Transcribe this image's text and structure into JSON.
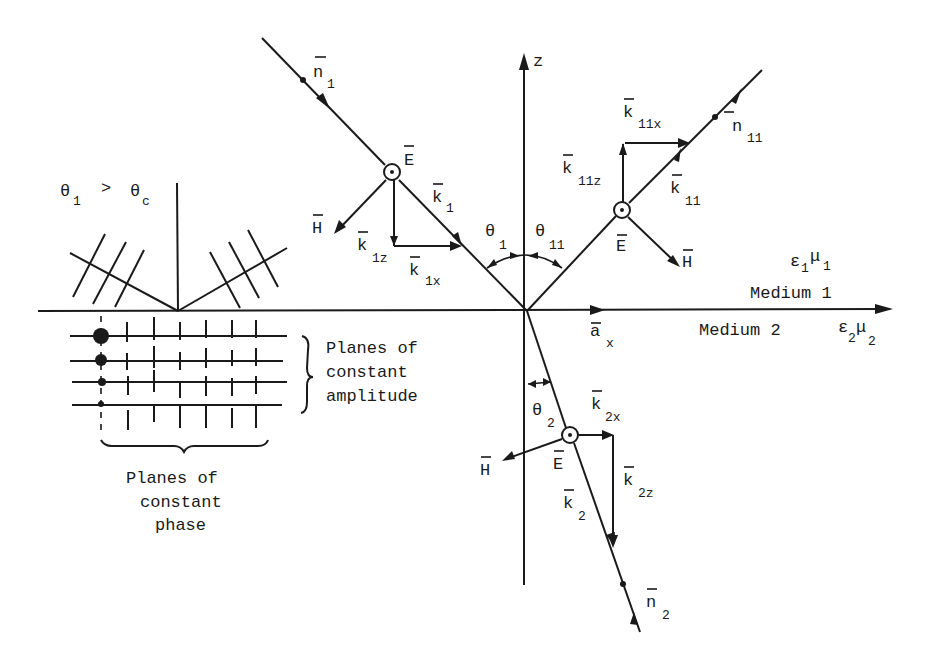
{
  "figure": {
    "condition": {
      "theta": "θ",
      "sub1": "1",
      "gt": ">",
      "theta_c": "θ",
      "subc": "c"
    },
    "axes": {
      "z_label": "z",
      "ax_label": "a",
      "ax_sub": "x"
    },
    "media": {
      "medium1": "Medium 1",
      "medium1_params": {
        "eps": "ε",
        "eps_sub": "1",
        "mu": "μ",
        "mu_sub": "1"
      },
      "medium2": "Medium 2",
      "medium2_params": {
        "eps": "ε",
        "eps_sub": "2",
        "mu": "μ",
        "mu_sub": "2"
      }
    },
    "incident": {
      "n": "n",
      "n_sub": "1",
      "E": "E",
      "H": "H",
      "k": "k",
      "k_sub": "1",
      "kz": "k",
      "kz_sub": "1z",
      "kx": "k",
      "kx_sub": "1x",
      "theta": "θ",
      "theta_sub": "1"
    },
    "reflected": {
      "n": "n",
      "n_sub": "11",
      "E": "E",
      "H": "H",
      "k": "k",
      "k_sub": "11",
      "kz": "k",
      "kz_sub": "11z",
      "kx": "k",
      "kx_sub": "11x",
      "theta": "θ",
      "theta_sub": "11"
    },
    "transmitted": {
      "n": "n",
      "n_sub": "2",
      "E": "E",
      "H": "H",
      "k": "k",
      "k_sub": "2",
      "kz": "k",
      "kz_sub": "2z",
      "kx": "k",
      "kx_sub": "2x",
      "theta": "θ",
      "theta_sub": "2"
    },
    "inset": {
      "amplitude_label": [
        "Planes of",
        "constant",
        "amplitude"
      ],
      "phase_label": [
        "Planes of",
        "constant",
        "phase"
      ]
    }
  }
}
